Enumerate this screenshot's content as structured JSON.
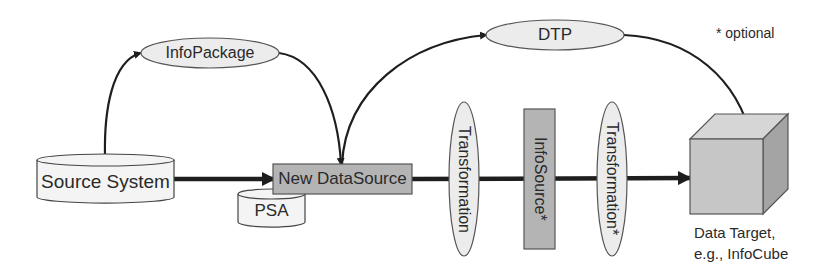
{
  "diagram": {
    "legend_note": "* optional",
    "nodes": {
      "source_system": {
        "label": "Source System",
        "shape": "cylinder"
      },
      "psa": {
        "label": "PSA",
        "shape": "cylinder"
      },
      "new_datasource": {
        "label": "New DataSource",
        "shape": "rectangle"
      },
      "infopackage": {
        "label": "InfoPackage",
        "shape": "ellipse"
      },
      "dtp": {
        "label": "DTP",
        "shape": "ellipse"
      },
      "transformation_1": {
        "label": "Transformation",
        "shape": "vertical-ellipse"
      },
      "infosource": {
        "label": "InfoSource*",
        "shape": "vertical-rectangle"
      },
      "transformation_2": {
        "label": "Transformation*",
        "shape": "vertical-ellipse"
      },
      "data_target": {
        "label_line1": "Data Target,",
        "label_line2": "e.g., InfoCube",
        "shape": "cube"
      }
    },
    "edges": [
      {
        "from": "Source System",
        "to": "InfoPackage",
        "style": "curved-arrow"
      },
      {
        "from": "InfoPackage",
        "to": "New DataSource",
        "style": "curved-arrow"
      },
      {
        "from": "Source System",
        "to": "New DataSource",
        "style": "thick-arrow"
      },
      {
        "from": "New DataSource",
        "to": "DTP",
        "style": "curved-arrow"
      },
      {
        "from": "DTP",
        "to": "Data Target",
        "style": "curved-arrow"
      },
      {
        "from": "New DataSource",
        "to": "Data Target",
        "style": "thick-arrow",
        "via": [
          "Transformation",
          "InfoSource*",
          "Transformation*"
        ]
      }
    ],
    "colors": {
      "stroke": "#333333",
      "ellipse_fill": "#ececec",
      "box_fill": "#b4b4b4",
      "cylinder_fill": "#f4f4f4",
      "cube_front": "#c6c6c6",
      "cube_top": "#d6d6d6",
      "cube_side": "#a4a4a4",
      "line": "#1e1e1e"
    }
  }
}
